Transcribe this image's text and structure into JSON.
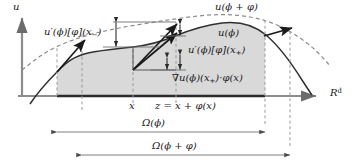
{
  "figure": {
    "kind": "shape-derivative-diagram",
    "axes": {
      "vertical_label": "u",
      "horizontal_label": "R",
      "horizontal_label_exponent": "d"
    },
    "curves": {
      "solid_label": "u(ϕ)",
      "dashed_label": "u(ϕ + φ)"
    },
    "labels": {
      "left_increment": {
        "fn": "u",
        "prime": "′",
        "arg": "(ϕ)",
        "bracket": "[φ]",
        "point": "(x",
        "point_sub": "−",
        "point_close": ")"
      },
      "right_increment": {
        "fn": "u",
        "prime": "′",
        "arg": "(ϕ)",
        "bracket": "[φ]",
        "point": "(x",
        "point_sub": "+",
        "point_close": ")"
      },
      "gradient": {
        "nabla": "∇u",
        "arg": "(ϕ)",
        "point": "(x",
        "point_sub": "+",
        "point_close": ")",
        "dot": "·",
        "perturb": "φ(x)"
      },
      "x_tick": "x",
      "z_tick": "z = x + φ(x)",
      "omega_phi": "Ω(ϕ)",
      "omega_phi_perturbed": "Ω(ϕ + φ)"
    },
    "colors": {
      "ink": "#1a1a1a",
      "fill": "#d9d9d9",
      "axis": "#888888",
      "dashed": "#9a9a9a",
      "thin": "#6f6f6f"
    }
  }
}
